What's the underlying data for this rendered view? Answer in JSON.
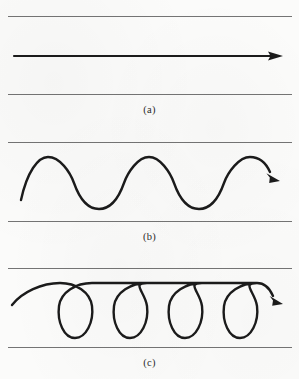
{
  "figure": {
    "background_color": "#fbfbfa",
    "rule_color": "#6d6d6d",
    "stroke_color": "#1b1b1b",
    "width": 299,
    "height": 379,
    "panels": [
      {
        "id": "a",
        "label": "(a)",
        "description": "straight horizontal arrow pointing right",
        "top_rule_y": 16,
        "bottom_rule_y": 94,
        "label_y": 104,
        "arrow": {
          "start_x": 14,
          "start_y": 56,
          "end_x": 283,
          "end_y": 56,
          "stroke_width": 2.1,
          "head_length": 12,
          "head_half_width": 3.6
        }
      },
      {
        "id": "b",
        "label": "(b)",
        "description": "transverse sine wave with arrowhead at the right end",
        "top_rule_y": 142,
        "bottom_rule_y": 221,
        "label_y": 231,
        "wave": {
          "start_x": 21,
          "start_y": 200,
          "crest_y": 157,
          "trough_y": 209,
          "crest_x_values": [
            48,
            149,
            250
          ],
          "trough_x_values": [
            99,
            199
          ],
          "stroke_width": 2.4,
          "arrow_tip_x": 280,
          "arrow_tip_y": 180,
          "head_length": 11,
          "head_half_width": 3.4
        }
      },
      {
        "id": "c",
        "label": "(c)",
        "description": "longitudinal looping helix wave with arrowhead at the right end",
        "top_rule_y": 268,
        "bottom_rule_y": 347,
        "label_y": 357,
        "helix": {
          "start_x": 12,
          "start_y": 305,
          "arc_top_y": 284,
          "loop_bottom_y": 338,
          "loop_count": 4,
          "loop_centers_x": [
            75,
            130,
            185,
            240
          ],
          "loop_half_width": 17,
          "stroke_width": 2.4,
          "arrow_tip_x": 283,
          "arrow_tip_y": 302,
          "head_length": 11,
          "head_half_width": 3.4
        }
      }
    ]
  }
}
